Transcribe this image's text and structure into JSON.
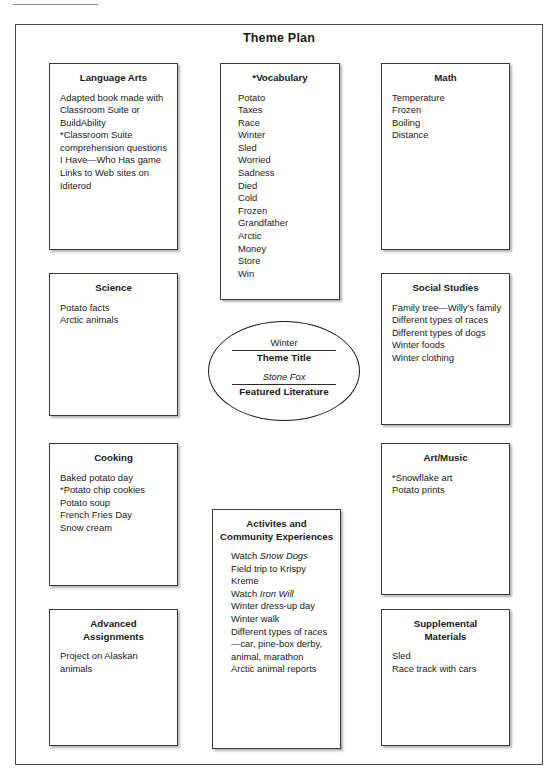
{
  "page": {
    "title": "Theme Plan"
  },
  "center": {
    "theme_value": "Winter",
    "theme_label": "Theme Title",
    "literature_value": "Stone Fox",
    "literature_label": "Featured Literature"
  },
  "cards": {
    "language_arts": {
      "title": "Language Arts",
      "items": [
        "Adapted book made with Classroom Suite or BuildAbility",
        "*Classroom Suite comprehension questions",
        "I Have—Who Has game",
        "Links to Web sites on Iditerod"
      ]
    },
    "vocabulary": {
      "title": "*Vocabulary",
      "items": [
        "Potato",
        "Taxes",
        "Race",
        "Winter",
        "Sled",
        "Worried",
        "Sadness",
        "Died",
        "Cold",
        "Frozen",
        "Grandfather",
        "Arctic",
        "Money",
        "Store",
        "Win"
      ]
    },
    "math": {
      "title": "Math",
      "items": [
        "Temperature",
        "Frozen",
        "Boiling",
        "Distance"
      ]
    },
    "science": {
      "title": "Science",
      "items": [
        "Potato facts",
        "Arctic animals"
      ]
    },
    "social_studies": {
      "title": "Social Studies",
      "items": [
        "Family tree—Willy's family",
        "Different types of races",
        "Different types of dogs",
        "Winter foods",
        "Winter clothing"
      ]
    },
    "cooking": {
      "title": "Cooking",
      "items": [
        "Baked potato day",
        "*Potato chip cookies",
        "Potato soup",
        "French Fries Day",
        "Snow cream"
      ]
    },
    "art_music": {
      "title": "Art/Music",
      "items": [
        "*Snowflake art",
        "Potato prints"
      ]
    },
    "activities": {
      "title_line1": "Activites and",
      "title_line2": "Community Experiences",
      "items": [
        {
          "pre": "Watch ",
          "italic": "Snow Dogs",
          "post": ""
        },
        {
          "pre": "Field trip to Krispy Kreme",
          "italic": "",
          "post": ""
        },
        {
          "pre": "Watch ",
          "italic": "Iron Will",
          "post": ""
        },
        {
          "pre": "Winter dress-up day",
          "italic": "",
          "post": ""
        },
        {
          "pre": "Winter walk",
          "italic": "",
          "post": ""
        },
        {
          "pre": "Different types of races—car, pine-box derby, animal, marathon",
          "italic": "",
          "post": ""
        },
        {
          "pre": "Arctic animal reports",
          "italic": "",
          "post": ""
        }
      ]
    },
    "advanced_assignments": {
      "title_line1": "Advanced",
      "title_line2": "Assignments",
      "items": [
        "Project on Alaskan animals"
      ]
    },
    "supplemental_materials": {
      "title_line1": "Supplemental",
      "title_line2": "Materials",
      "items": [
        "Sled",
        "Race track with cars"
      ]
    }
  }
}
